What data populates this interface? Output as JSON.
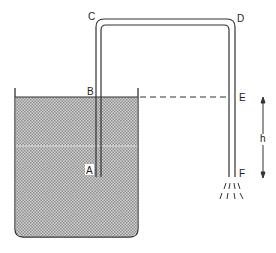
{
  "diagram": {
    "labels": {
      "A": "A",
      "B": "B",
      "C": "C",
      "D": "D",
      "E": "E",
      "F": "F",
      "h": "h"
    },
    "colors": {
      "outline": "#333333",
      "water_fill": "#b8b8b8",
      "background": "#ffffff"
    }
  }
}
